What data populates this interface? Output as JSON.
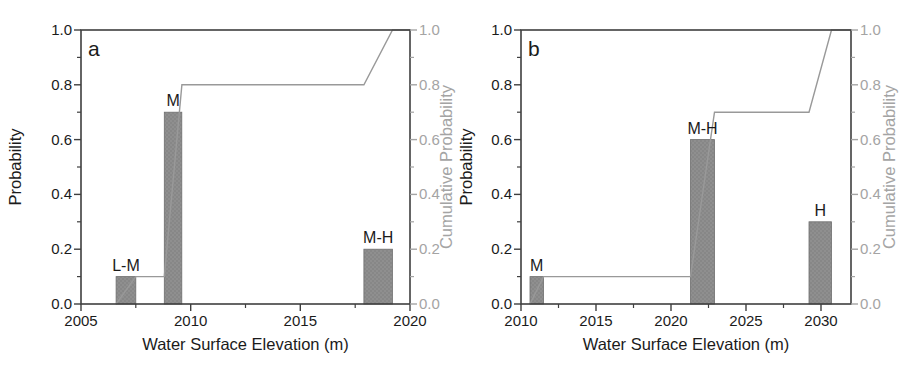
{
  "colors": {
    "background": "#ffffff",
    "axis_frame": "#3f3f3f",
    "primary_text": "#1b1b1b",
    "secondary_text": "#a4a4a4",
    "bar_fill": "#8f8f8f",
    "bar_speckle": "#787878",
    "bar_edge": "#6e6e6e",
    "cumulative_line": "#999999"
  },
  "chart_data": [
    {
      "type": "bar",
      "panel_label": "a",
      "xlabel": "Water Surface Elevation (m)",
      "ylabel_left": "Probability",
      "ylabel_right": "Cumulative Probability",
      "xlim": [
        2005,
        2020
      ],
      "ylim": [
        0,
        1
      ],
      "x_major_ticks": [
        2005,
        2010,
        2015,
        2020
      ],
      "x_minor_ticks": [
        2007.5,
        2012.5,
        2017.5
      ],
      "y_major_ticks": [
        0.0,
        0.2,
        0.4,
        0.6,
        0.8,
        1.0
      ],
      "y_tick_labels": [
        "0.0",
        "0.2",
        "0.4",
        "0.6",
        "0.8",
        "1.0"
      ],
      "y_minor_ticks": [
        0.1,
        0.3,
        0.5,
        0.7,
        0.9
      ],
      "grid": false,
      "bars": [
        {
          "label": "L-M",
          "x_start": 2006.6,
          "x_end": 2007.5,
          "probability": 0.1
        },
        {
          "label": "M",
          "x_start": 2008.8,
          "x_end": 2009.6,
          "probability": 0.7
        },
        {
          "label": "M-H",
          "x_start": 2017.9,
          "x_end": 2019.2,
          "probability": 0.2
        }
      ],
      "cumulative_points": [
        [
          2006.6,
          0.0
        ],
        [
          2007.5,
          0.1
        ],
        [
          2008.8,
          0.1
        ],
        [
          2009.6,
          0.8
        ],
        [
          2017.9,
          0.8
        ],
        [
          2019.2,
          1.0
        ],
        [
          2020.0,
          1.0
        ]
      ]
    },
    {
      "type": "bar",
      "panel_label": "b",
      "xlabel": "Water Surface Elevation (m)",
      "ylabel_left": "Probability",
      "ylabel_right": "Cumulative Probability",
      "xlim": [
        2010,
        2032
      ],
      "ylim": [
        0,
        1
      ],
      "x_major_ticks": [
        2010,
        2015,
        2020,
        2025,
        2030
      ],
      "x_minor_ticks": [
        2012.5,
        2017.5,
        2022.5,
        2027.5
      ],
      "y_major_ticks": [
        0.0,
        0.2,
        0.4,
        0.6,
        0.8,
        1.0
      ],
      "y_tick_labels": [
        "0.0",
        "0.2",
        "0.4",
        "0.6",
        "0.8",
        "1.0"
      ],
      "y_minor_ticks": [
        0.1,
        0.3,
        0.5,
        0.7,
        0.9
      ],
      "grid": false,
      "bars": [
        {
          "label": "M",
          "x_start": 2010.6,
          "x_end": 2011.5,
          "probability": 0.1
        },
        {
          "label": "M-H",
          "x_start": 2021.3,
          "x_end": 2022.9,
          "probability": 0.6
        },
        {
          "label": "H",
          "x_start": 2029.2,
          "x_end": 2030.7,
          "probability": 0.3
        }
      ],
      "cumulative_points": [
        [
          2010.6,
          0.0
        ],
        [
          2011.5,
          0.1
        ],
        [
          2021.3,
          0.1
        ],
        [
          2022.9,
          0.7
        ],
        [
          2029.2,
          0.7
        ],
        [
          2030.7,
          1.0
        ],
        [
          2032.0,
          1.0
        ]
      ]
    }
  ]
}
